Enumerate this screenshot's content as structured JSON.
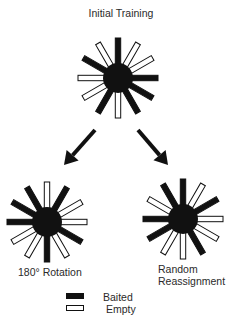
{
  "diagram": {
    "title": "Initial Training",
    "colors": {
      "baited": "#111111",
      "empty": "#ffffff",
      "stroke": "#111111"
    },
    "arm_angles_deg": [
      0,
      30,
      60,
      90,
      120,
      150,
      180,
      210,
      240,
      270,
      300,
      330
    ],
    "mazes": [
      {
        "id": "initial-training",
        "label": "Initial Training",
        "center": [
          118,
          78
        ],
        "arms": [
          "baited",
          "empty",
          "empty",
          "baited",
          "baited",
          "baited",
          "empty",
          "baited",
          "empty",
          "empty",
          "baited",
          "empty"
        ]
      },
      {
        "id": "rotation-180",
        "label": "180° Rotation",
        "center": [
          47,
          222
        ],
        "arms": [
          "empty",
          "baited",
          "empty",
          "empty",
          "baited",
          "empty",
          "baited",
          "empty",
          "empty",
          "baited",
          "baited",
          "baited"
        ]
      },
      {
        "id": "random-reassignment",
        "label_lines": [
          "Random",
          "Reassignment"
        ],
        "center": [
          183,
          219
        ],
        "arms": [
          "baited",
          "empty",
          "baited",
          "empty",
          "empty",
          "baited",
          "empty",
          "empty",
          "baited",
          "baited",
          "empty",
          "baited"
        ]
      }
    ],
    "arrows": [
      {
        "from": [
          95,
          130
        ],
        "to": [
          64,
          165
        ]
      },
      {
        "from": [
          138,
          130
        ],
        "to": [
          168,
          165
        ]
      }
    ],
    "labels": {
      "rotation": "180° Rotation",
      "random_line1": "Random",
      "random_line2": "Reassignment"
    },
    "legend": [
      {
        "label": "Baited",
        "style": "baited"
      },
      {
        "label": "Empty",
        "style": "empty"
      }
    ]
  }
}
